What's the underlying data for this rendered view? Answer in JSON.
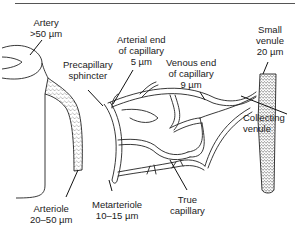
{
  "diagram": {
    "labels": {
      "artery": {
        "name": "Artery",
        "size": ">50 µm"
      },
      "arterial_end": {
        "line1": "Arterial end",
        "line2": "of capillary",
        "size": "5 µm"
      },
      "precapillary_sphincter": {
        "line1": "Precapillary",
        "line2": "sphincter"
      },
      "small_venule": {
        "line1": "Small",
        "line2": "venule",
        "size": "20 µm"
      },
      "venous_end": {
        "line1": "Venous end",
        "line2": "of capillary",
        "size": "9 µm"
      },
      "collecting_venule": {
        "line1": "Collecting",
        "line2": "venule"
      },
      "arteriole": {
        "name": "Arteriole",
        "size": "20–50 µm"
      },
      "metarteriole": {
        "name": "Metarteriole",
        "size": "10–15 µm"
      },
      "true_capillary": {
        "line1": "True",
        "line2": "capillary"
      }
    },
    "colors": {
      "ink": "#222222",
      "background": "#ffffff",
      "stipple": "#444444"
    }
  }
}
